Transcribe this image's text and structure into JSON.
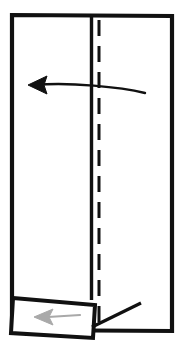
{
  "image": {
    "title": "Paper folding instruction diagram",
    "width": 179,
    "height": 342,
    "background_color": "#ffffff"
  },
  "colors": {
    "outline": "#111111",
    "fold_line": "#111111",
    "crease_dashed": "#111111",
    "arrow_black": "#111111",
    "arrow_gray": "#a9a9a9",
    "paper_fill": "#ffffff"
  },
  "shapes": {
    "main_panel": {
      "name": "paper-sheet-outline",
      "description": "tall upright rectangle representing the sheet of paper",
      "points": "12,15 172,16 172,331 12,330",
      "stroke_width": 4.2
    },
    "vertical_fold_line": {
      "name": "vertical-fold-line",
      "description": "solid vertical line marking the folded panel edge",
      "x1": 91.5,
      "y1": 17,
      "x2": 91.5,
      "y2": 300,
      "stroke_width": 3.4
    },
    "dashed_crease": {
      "name": "dashed-crease-line",
      "description": "dashed vertical valley-fold crease line",
      "x1": 99,
      "y1": 20,
      "x2": 99,
      "y2": 326,
      "stroke_width": 3.0,
      "dash_pattern": "16 10"
    },
    "bottom_flap": {
      "name": "bottom-flap-outline",
      "description": "tilted quadrilateral flap folded out at the bottom left",
      "points": "13,298 95,305 93,338 11,333",
      "stroke_width": 4.0
    },
    "flap_connector": {
      "name": "flap-connector-line",
      "description": "black line running from the flap corner up toward the right",
      "x1": 92,
      "y1": 327,
      "x2": 141,
      "y2": 303,
      "stroke_width": 3.2
    }
  },
  "arrows": [
    {
      "name": "fold-left-arrow",
      "color": "#111111",
      "direction": "left",
      "style": "solid-curved",
      "tail_path": "M145,93 C120,87 70,82 35,85",
      "head_points": "28,85 47,76 44,85 47,94",
      "stroke_width": 2.4,
      "meaning": "fold the right panel over to the left"
    },
    {
      "name": "flap-fold-arrow",
      "color": "#a9a9a9",
      "direction": "left",
      "style": "solid-straight",
      "tail_path": "M80,315 L48,317",
      "head_points": "34,317 53,309 49,317 53,325",
      "stroke_width": 2.2,
      "meaning": "fold the bottom flap toward the left"
    }
  ]
}
